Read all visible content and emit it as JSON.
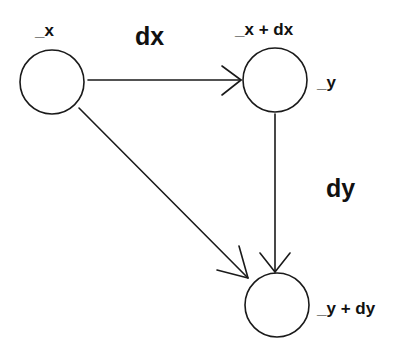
{
  "diagram": {
    "type": "directed-graph",
    "nodes": [
      {
        "id": "n_x",
        "label": "_x",
        "cx": 52,
        "cy": 82,
        "r": 32
      },
      {
        "id": "n_x_dx",
        "label": "_x + dx",
        "side_label": "_y",
        "cx": 275,
        "cy": 80,
        "r": 32
      },
      {
        "id": "n_y_dy",
        "label": "_y + dy",
        "cx": 277,
        "cy": 305,
        "r": 32
      }
    ],
    "edges": [
      {
        "from": "n_x",
        "to": "n_x_dx",
        "label": "dx"
      },
      {
        "from": "n_x_dx",
        "to": "n_y_dy",
        "label": "dy"
      },
      {
        "from": "n_x",
        "to": "n_y_dy",
        "label": ""
      }
    ],
    "labels": {
      "node_x": "_x",
      "node_x_dx": "_x + dx",
      "node_y": "_y",
      "node_y_dy": "_y + dy",
      "edge_dx": "dx",
      "edge_dy": "dy"
    },
    "colors": {
      "stroke": "#1a1a1a",
      "text": "#111111",
      "background": "#ffffff"
    }
  }
}
